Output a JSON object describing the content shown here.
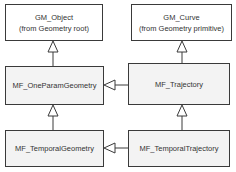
{
  "diagram": {
    "nodes": {
      "gm_object": {
        "name": "GM_Object",
        "note": "(from Geometry root)"
      },
      "gm_curve": {
        "name": "GM_Curve",
        "note": "(from Geometry primitive)"
      },
      "one_param": {
        "name": "MF_OneParamGeometry"
      },
      "trajectory": {
        "name": "MF_Trajectory"
      },
      "temporal_geometry": {
        "name": "MF_TemporalGeometry"
      },
      "temporal_trajectory": {
        "name": "MF_TemporalTrajectory"
      }
    },
    "edges": [
      {
        "from": "MF_OneParamGeometry",
        "to": "GM_Object",
        "type": "generalization"
      },
      {
        "from": "MF_Trajectory",
        "to": "GM_Curve",
        "type": "generalization"
      },
      {
        "from": "MF_Trajectory",
        "to": "MF_OneParamGeometry",
        "type": "generalization"
      },
      {
        "from": "MF_TemporalGeometry",
        "to": "MF_OneParamGeometry",
        "type": "generalization"
      },
      {
        "from": "MF_TemporalTrajectory",
        "to": "MF_Trajectory",
        "type": "generalization"
      },
      {
        "from": "MF_TemporalTrajectory",
        "to": "MF_TemporalGeometry",
        "type": "generalization"
      }
    ],
    "colors": {
      "border": "#3a3a3a",
      "class_fill": "#f3f3f3",
      "external_fill": "#ffffff"
    }
  }
}
